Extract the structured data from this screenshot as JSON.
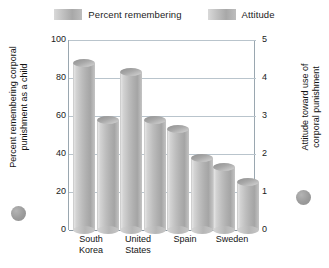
{
  "chart_data": {
    "type": "bar",
    "title": "",
    "categories": [
      "South Korea",
      "United States",
      "Spain",
      "Sweden"
    ],
    "series": [
      {
        "name": "Percent remembering",
        "axis": "left",
        "values": [
          88,
          83,
          53,
          33
        ]
      },
      {
        "name": "Attitude",
        "axis": "right",
        "values": [
          2.9,
          2.9,
          1.9,
          1.25
        ]
      }
    ],
    "xlabel": "",
    "ylabel": "Percent remembering corporal punishment as a child",
    "y2label": "Attitude toward use of corporal punishment",
    "ylim": [
      0,
      100
    ],
    "y2lim": [
      0,
      5
    ],
    "yticks": [
      "0",
      "20",
      "40",
      "60",
      "80",
      "100"
    ],
    "y2ticks": [
      "0",
      "1",
      "2",
      "3",
      "4",
      "5"
    ],
    "grid": true,
    "legend_position": "top"
  },
  "legend": {
    "items": [
      {
        "label": "Percent remembering"
      },
      {
        "label": "Attitude"
      }
    ]
  },
  "axes": {
    "left_title": "Percent remembering corporal\npunishment as a child",
    "right_title": "Attitude toward use of\ncorporal punishment"
  },
  "colors": {
    "bar_light": "#e4e4e4",
    "bar_mid": "#bdbdbd",
    "bar_dark": "#a5a5a5",
    "gridline": "#b9c4cc",
    "axis": "#9aa7b0",
    "text": "#1b1b1b",
    "marker": "#9b9b9b"
  }
}
